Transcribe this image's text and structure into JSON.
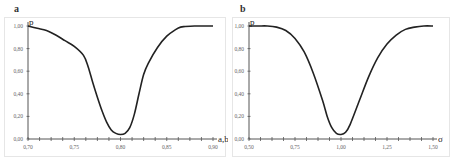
{
  "chart_data": [
    {
      "panel": "a",
      "type": "line",
      "title": "",
      "xlabel": "a,b",
      "ylabel": "p",
      "xlim": [
        0.7,
        0.9
      ],
      "ylim": [
        0.0,
        1.0
      ],
      "grid": false,
      "legend": null,
      "x_ticks": [
        "0,70",
        "0,75",
        "0,80",
        "0,85",
        "0,90"
      ],
      "y_ticks": [
        "0,00",
        "0,20",
        "0,40",
        "0,60",
        "0,80",
        "1,00"
      ],
      "series": [
        {
          "name": "p",
          "x": [
            0.7,
            0.71,
            0.72,
            0.73,
            0.74,
            0.75,
            0.76,
            0.765,
            0.77,
            0.775,
            0.78,
            0.785,
            0.79,
            0.795,
            0.8,
            0.805,
            0.81,
            0.815,
            0.82,
            0.825,
            0.83,
            0.84,
            0.85,
            0.86,
            0.865,
            0.87,
            0.88,
            0.89,
            0.9
          ],
          "y": [
            1.0,
            0.98,
            0.96,
            0.92,
            0.87,
            0.82,
            0.74,
            0.64,
            0.5,
            0.37,
            0.25,
            0.15,
            0.08,
            0.05,
            0.04,
            0.05,
            0.1,
            0.22,
            0.4,
            0.57,
            0.67,
            0.81,
            0.91,
            0.97,
            0.99,
            0.995,
            1.0,
            1.0,
            1.0
          ]
        }
      ]
    },
    {
      "panel": "b",
      "type": "line",
      "title": "",
      "xlabel": "σ",
      "ylabel": "p",
      "xlim": [
        0.5,
        1.5
      ],
      "ylim": [
        0.0,
        1.0
      ],
      "grid": false,
      "legend": null,
      "x_ticks": [
        "0,50",
        "0,75",
        "1,00",
        "1,25",
        "1,50"
      ],
      "y_ticks": [
        "0,00",
        "0,20",
        "0,40",
        "0,60",
        "0,80",
        "1,00"
      ],
      "series": [
        {
          "name": "p",
          "x": [
            0.5,
            0.55,
            0.6,
            0.65,
            0.7,
            0.75,
            0.8,
            0.85,
            0.9,
            0.925,
            0.95,
            0.975,
            1.0,
            1.025,
            1.05,
            1.1,
            1.15,
            1.2,
            1.25,
            1.3,
            1.35,
            1.4,
            1.45,
            1.5
          ],
          "y": [
            1.0,
            1.0,
            1.0,
            0.99,
            0.96,
            0.89,
            0.77,
            0.58,
            0.34,
            0.2,
            0.1,
            0.05,
            0.04,
            0.06,
            0.13,
            0.34,
            0.55,
            0.72,
            0.84,
            0.92,
            0.97,
            0.99,
            1.0,
            1.0
          ]
        }
      ]
    }
  ],
  "panels": {
    "a": {
      "letter": "a",
      "x_axis_title": "a,b",
      "y_axis_title": "p"
    },
    "b": {
      "letter": "b",
      "x_axis_title": "σ",
      "y_axis_title": "p"
    }
  },
  "colors": {
    "curve": "#222222",
    "axis": "#555555",
    "frame": "#e6e6e6",
    "tick_text": "#666666"
  }
}
